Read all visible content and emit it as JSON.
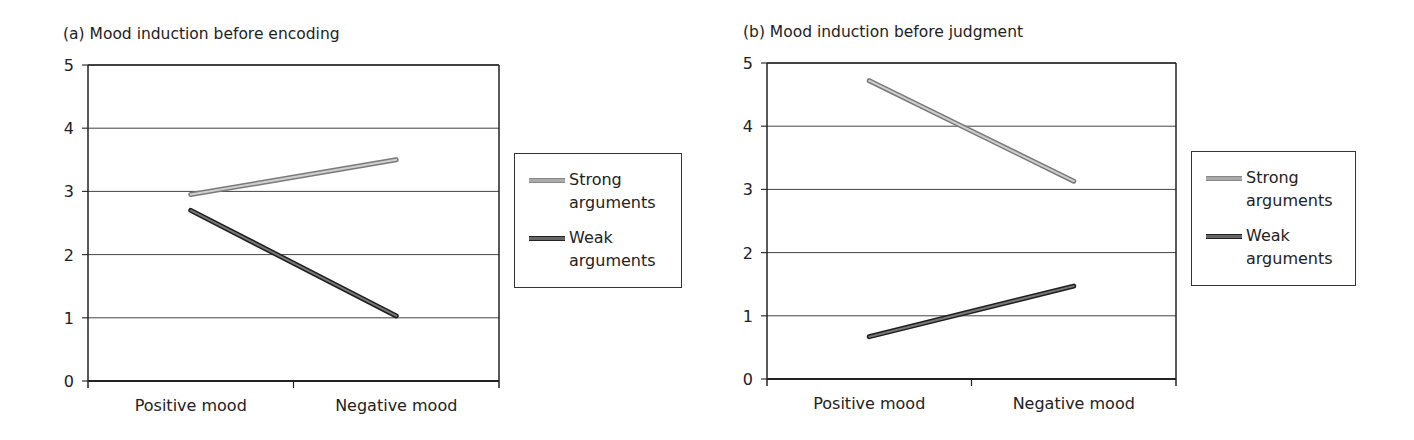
{
  "chart_data": [
    {
      "type": "line",
      "title": "(a)  Mood induction before encoding",
      "categories": [
        "Positive mood",
        "Negative mood"
      ],
      "series": [
        {
          "name": "Strong arguments",
          "values": [
            2.95,
            3.5
          ],
          "color": "#aaaaaa"
        },
        {
          "name": "Weak arguments",
          "values": [
            2.7,
            1.03
          ],
          "color": "#555555"
        }
      ],
      "xlabel": "",
      "ylabel": "",
      "ylim": [
        0,
        5
      ],
      "yticks": [
        0,
        1,
        2,
        3,
        4,
        5
      ],
      "grid": true,
      "legend_position": "right"
    },
    {
      "type": "line",
      "title": "(b)  Mood induction before judgment",
      "categories": [
        "Positive mood",
        "Negative mood"
      ],
      "series": [
        {
          "name": "Strong arguments",
          "values": [
            4.72,
            3.13
          ],
          "color": "#aaaaaa"
        },
        {
          "name": "Weak arguments",
          "values": [
            0.67,
            1.47
          ],
          "color": "#555555"
        }
      ],
      "xlabel": "",
      "ylabel": "",
      "ylim": [
        0,
        5
      ],
      "yticks": [
        0,
        1,
        2,
        3,
        4,
        5
      ],
      "grid": true,
      "legend_position": "right"
    }
  ],
  "panels": [
    {
      "title": "(a)  Mood induction before encoding",
      "legend": {
        "strong": "Strong arguments",
        "weak": "Weak arguments"
      }
    },
    {
      "title": "(b)  Mood induction before judgment",
      "legend": {
        "strong": "Strong arguments",
        "weak": "Weak arguments"
      }
    }
  ]
}
